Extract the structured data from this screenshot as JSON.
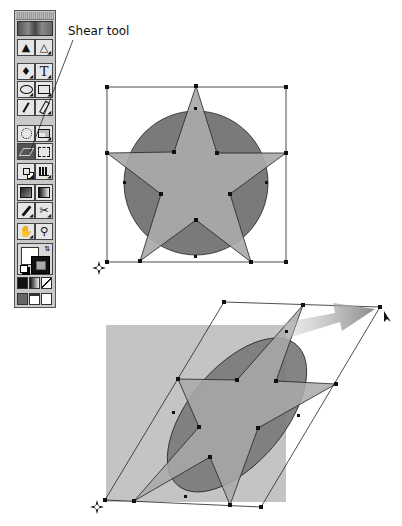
{
  "callout": {
    "label": "Shear tool"
  },
  "toolbox": {
    "tools": [
      {
        "left": "selection-tool",
        "right": "direct-selection-tool"
      },
      {
        "left": "pen-tool",
        "right": "type-tool"
      },
      {
        "left": "ellipse-tool",
        "right": "rectangle-tool"
      },
      {
        "left": "paintbrush-tool",
        "right": "pencil-tool"
      },
      {
        "left": "rotate-tool",
        "right": "scale-tool"
      },
      {
        "left": "shear-tool",
        "right": "free-transform-tool",
        "selected": "left"
      },
      {
        "left": "blend-tool",
        "right": "column-graph-tool"
      },
      {
        "left": "gradient-mesh-tool",
        "right": "gradient-tool"
      },
      {
        "left": "eyedropper-tool",
        "right": "scissors-tool"
      },
      {
        "left": "hand-tool",
        "right": "zoom-tool"
      }
    ],
    "glyphs": {
      "type": "T",
      "selection": "➤",
      "scissors": "✂"
    },
    "fill_stroke": {
      "fill": "#ffffff",
      "stroke": "#111111"
    },
    "paint_modes": [
      "color",
      "gradient",
      "none"
    ],
    "screen_modes": [
      "standard-screen",
      "full-screen-menu",
      "full-screen"
    ]
  },
  "figures": {
    "colors": {
      "circle": "#7a7a7a",
      "star": "#a9a9a9",
      "square": "#c4c4c4",
      "outline": "#222222",
      "arrow": "#8e8e8e"
    },
    "before": "star-over-circle-with-bounding-box",
    "after": "sheared-star-over-ellipse-with-parallelogram-box"
  }
}
